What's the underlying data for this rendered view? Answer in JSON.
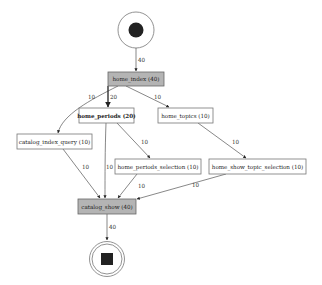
{
  "diagram": {
    "type": "process-flow-graph",
    "colors": {
      "highlight_fill": "#b4b4b4",
      "box_fill": "#ffffff",
      "edge": "#555555",
      "marker": "#222222"
    },
    "start": {
      "label": ""
    },
    "end": {
      "label": ""
    },
    "nodes": {
      "home_index": {
        "label": "home_index (40)",
        "highlighted": true
      },
      "home_periods": {
        "label": "home_periods (20)",
        "highlighted": false,
        "bold": true
      },
      "home_topics": {
        "label": "home_topics (10)",
        "highlighted": false
      },
      "catalog_index_query": {
        "label": "catalog_index_query (10)",
        "highlighted": false
      },
      "home_periods_selection": {
        "label": "home_periods_selection (10)",
        "highlighted": false
      },
      "home_show_topic_selection": {
        "label": "home_show_topic_selection (10)",
        "highlighted": false
      },
      "catalog_show": {
        "label": "catalog_show (40)",
        "highlighted": true
      }
    },
    "edges": {
      "start_to_home_index": {
        "from": "start",
        "to": "home_index",
        "label": "40"
      },
      "home_index_to_catalog_index_query": {
        "from": "home_index",
        "to": "catalog_index_query",
        "label": "10"
      },
      "home_index_to_home_periods": {
        "from": "home_index",
        "to": "home_periods",
        "label": "20"
      },
      "home_index_to_home_topics": {
        "from": "home_index",
        "to": "home_topics",
        "label": "10"
      },
      "home_periods_to_home_periods_selection": {
        "from": "home_periods",
        "to": "home_periods_selection",
        "label": "10"
      },
      "home_periods_to_catalog_show": {
        "from": "home_periods",
        "to": "catalog_show",
        "label": "10"
      },
      "home_topics_to_home_show_topic_selection": {
        "from": "home_topics",
        "to": "home_show_topic_selection",
        "label": "10"
      },
      "catalog_index_query_to_catalog_show": {
        "from": "catalog_index_query",
        "to": "catalog_show",
        "label": "10"
      },
      "home_periods_selection_to_catalog_show": {
        "from": "home_periods_selection",
        "to": "catalog_show",
        "label": "10"
      },
      "home_show_topic_selection_to_catalog_show": {
        "from": "home_show_topic_selection",
        "to": "catalog_show",
        "label": "10"
      },
      "catalog_show_to_end": {
        "from": "catalog_show",
        "to": "end",
        "label": "40"
      }
    }
  }
}
